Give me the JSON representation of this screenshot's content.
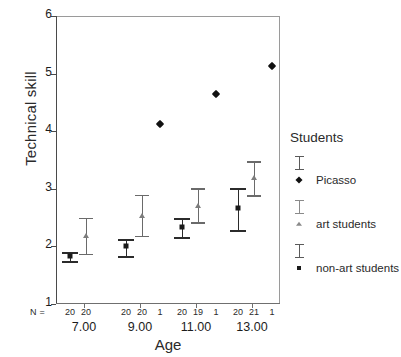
{
  "chart_data": {
    "type": "scatter",
    "title": "",
    "xlabel": "Age",
    "ylabel": "Technical skill",
    "ylim": [
      1,
      6
    ],
    "yticks": [
      "1",
      "2",
      "3",
      "4",
      "5",
      "6"
    ],
    "grid": false,
    "legend_position": "right",
    "legend_title": "Students",
    "categories": [
      "7.00",
      "9.00",
      "11.00",
      "13.00"
    ],
    "n_row_label": "N =",
    "series": [
      {
        "name": "non-art students",
        "marker": "square",
        "color": "#1a1a1a",
        "values": [
          1.83,
          2.0,
          2.33,
          2.66
        ],
        "ci_low": [
          1.75,
          1.84,
          2.17,
          2.29
        ],
        "ci_high": [
          1.91,
          2.13,
          2.49,
          3.02
        ],
        "n": [
          "20",
          "20",
          "20",
          "20"
        ]
      },
      {
        "name": "art students",
        "marker": "triangle",
        "color": "#7d7d7d",
        "values": [
          2.18,
          2.53,
          2.7,
          3.18
        ],
        "ci_low": [
          1.87,
          2.18,
          2.42,
          2.89
        ],
        "ci_high": [
          2.5,
          2.9,
          3.01,
          3.48
        ],
        "n": [
          "20",
          "20",
          "19",
          "21"
        ]
      },
      {
        "name": "Picasso",
        "marker": "diamond",
        "color": "#111111",
        "values": [
          null,
          4.13,
          4.64,
          5.13
        ],
        "ci_low": [
          null,
          null,
          null,
          null
        ],
        "ci_high": [
          null,
          null,
          null,
          null
        ],
        "n": [
          "",
          "1",
          "1",
          "1"
        ]
      }
    ]
  },
  "legend": {
    "title": "Students",
    "entries": [
      {
        "label": "Picasso",
        "marker": "diamond"
      },
      {
        "label": "art students",
        "marker": "triangle"
      },
      {
        "label": "non-art students",
        "marker": "square"
      }
    ]
  },
  "axes": {
    "y_title": "Technical skill",
    "x_title": "Age",
    "y_ticks": [
      "6",
      "5",
      "4",
      "3",
      "2",
      "1"
    ],
    "x_group_labels": [
      "7.00",
      "9.00",
      "11.00",
      "13.00"
    ]
  },
  "n_row": {
    "label": "N =",
    "groups": [
      [
        "20",
        "20"
      ],
      [
        "20",
        "20",
        "1"
      ],
      [
        "20",
        "19",
        "1"
      ],
      [
        "20",
        "21",
        "1"
      ]
    ]
  },
  "colors": {
    "non_art": "#1a1a1a",
    "art": "#7d7d7d",
    "picasso": "#111111",
    "frame": "#9a9a9a",
    "axis": "#4a4a4a"
  }
}
